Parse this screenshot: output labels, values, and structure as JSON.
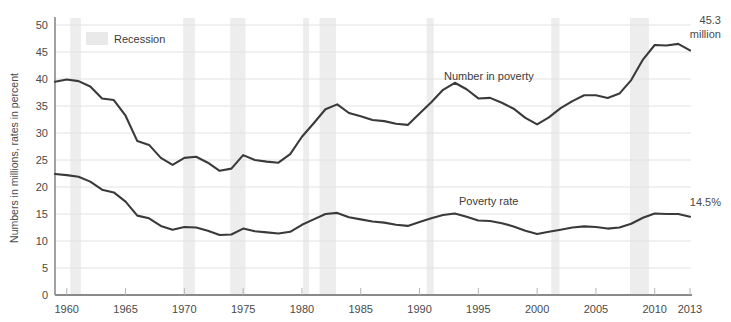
{
  "chart_data": {
    "type": "line",
    "title": "",
    "xlabel": "",
    "ylabel": "Numbers in millions, rates in percent",
    "xlim": [
      1959,
      2013
    ],
    "ylim": [
      0,
      50
    ],
    "yticks": [
      0,
      5,
      10,
      15,
      20,
      25,
      30,
      35,
      40,
      45,
      50
    ],
    "xticks": [
      1960,
      1965,
      1970,
      1975,
      1980,
      1985,
      1990,
      1995,
      2000,
      2005,
      2010,
      2013
    ],
    "grid": true,
    "legend_position": "top-left",
    "x": [
      1959,
      1960,
      1961,
      1962,
      1963,
      1964,
      1965,
      1966,
      1967,
      1968,
      1969,
      1970,
      1971,
      1972,
      1973,
      1974,
      1975,
      1976,
      1977,
      1978,
      1979,
      1980,
      1981,
      1982,
      1983,
      1984,
      1985,
      1986,
      1987,
      1988,
      1989,
      1990,
      1991,
      1992,
      1993,
      1994,
      1995,
      1996,
      1997,
      1998,
      1999,
      2000,
      2001,
      2002,
      2003,
      2004,
      2005,
      2006,
      2007,
      2008,
      2009,
      2010,
      2011,
      2012,
      2013
    ],
    "series": [
      {
        "name": "Number in poverty",
        "unit": "million",
        "values": [
          39.5,
          39.9,
          39.6,
          38.6,
          36.4,
          36.1,
          33.2,
          28.5,
          27.8,
          25.4,
          24.1,
          25.4,
          25.6,
          24.5,
          23.0,
          23.4,
          25.9,
          25.0,
          24.7,
          24.5,
          26.1,
          29.3,
          31.8,
          34.4,
          35.3,
          33.7,
          33.1,
          32.4,
          32.2,
          31.7,
          31.5,
          33.6,
          35.7,
          38.0,
          39.3,
          38.1,
          36.4,
          36.5,
          35.6,
          34.5,
          32.8,
          31.6,
          32.9,
          34.6,
          35.9,
          37.0,
          37.0,
          36.5,
          37.3,
          39.8,
          43.6,
          46.3,
          46.2,
          46.5,
          45.3
        ],
        "end_label": "45.3\nmillion",
        "end_value": 45.3
      },
      {
        "name": "Poverty rate",
        "unit": "percent",
        "values": [
          22.4,
          22.2,
          21.9,
          21.0,
          19.5,
          19.0,
          17.3,
          14.7,
          14.2,
          12.8,
          12.1,
          12.6,
          12.5,
          11.9,
          11.1,
          11.2,
          12.3,
          11.8,
          11.6,
          11.4,
          11.7,
          13.0,
          14.0,
          15.0,
          15.2,
          14.4,
          14.0,
          13.6,
          13.4,
          13.0,
          12.8,
          13.5,
          14.2,
          14.8,
          15.1,
          14.5,
          13.8,
          13.7,
          13.3,
          12.7,
          11.9,
          11.3,
          11.7,
          12.1,
          12.5,
          12.7,
          12.6,
          12.3,
          12.5,
          13.2,
          14.3,
          15.1,
          15.0,
          15.0,
          14.5
        ],
        "end_label": "14.5%",
        "end_value": 14.5
      }
    ],
    "recessions": [
      {
        "start": 1960.3,
        "end": 1961.2
      },
      {
        "start": 1969.9,
        "end": 1970.9
      },
      {
        "start": 1973.9,
        "end": 1975.2
      },
      {
        "start": 1980.1,
        "end": 1980.6
      },
      {
        "start": 1981.5,
        "end": 1982.9
      },
      {
        "start": 1990.6,
        "end": 1991.2
      },
      {
        "start": 2001.2,
        "end": 2001.9
      },
      {
        "start": 2007.9,
        "end": 2009.5
      }
    ],
    "legend": {
      "swatch_color": "#e9e9e9",
      "label": "Recession"
    },
    "colors": {
      "line": "#3a3a3a",
      "grid": "#e2e2e2",
      "axis": "#8a8a8a",
      "recession_band": "#ededed",
      "text": "#4a4a4a"
    },
    "series_label_positions": [
      {
        "name": "Number in poverty",
        "x": 444,
        "y": 70
      },
      {
        "name": "Poverty rate",
        "x": 459,
        "y": 195
      }
    ]
  }
}
